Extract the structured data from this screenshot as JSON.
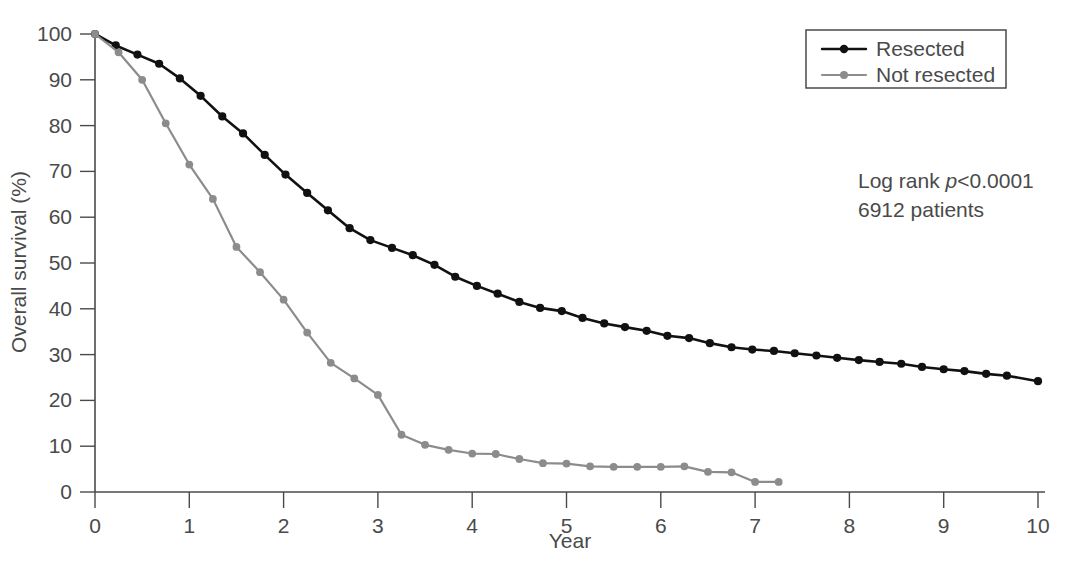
{
  "chart_data": {
    "type": "line",
    "title": "",
    "xlabel": "Year",
    "ylabel": "Overall survival (%)",
    "xlim": [
      0,
      10
    ],
    "ylim": [
      0,
      100
    ],
    "xticks": [
      "0",
      "1",
      "2",
      "3",
      "4",
      "5",
      "6",
      "7",
      "8",
      "9",
      "10"
    ],
    "yticks": [
      "0",
      "10",
      "20",
      "30",
      "40",
      "50",
      "60",
      "70",
      "80",
      "90",
      "100"
    ],
    "grid": false,
    "legend_position": "top-right",
    "series": [
      {
        "name": "Resected",
        "color": "#111111",
        "marker": "circle",
        "x": [
          0,
          0.22,
          0.45,
          0.68,
          0.9,
          1.12,
          1.35,
          1.57,
          1.8,
          2.02,
          2.25,
          2.47,
          2.7,
          2.92,
          3.15,
          3.37,
          3.6,
          3.82,
          4.05,
          4.27,
          4.5,
          4.72,
          4.95,
          5.17,
          5.4,
          5.62,
          5.85,
          6.07,
          6.3,
          6.52,
          6.75,
          6.97,
          7.2,
          7.42,
          7.65,
          7.87,
          8.1,
          8.32,
          8.55,
          8.77,
          9.0,
          9.22,
          9.45,
          9.67,
          10.0
        ],
        "values": [
          100,
          97.5,
          95.5,
          93.5,
          90.3,
          86.5,
          82.0,
          78.3,
          73.6,
          69.3,
          65.3,
          61.5,
          57.6,
          55.0,
          53.3,
          51.7,
          49.6,
          47.0,
          45.0,
          43.3,
          41.5,
          40.2,
          39.5,
          38.0,
          36.8,
          36.0,
          35.2,
          34.1,
          33.6,
          32.5,
          31.6,
          31.1,
          30.8,
          30.3,
          29.8,
          29.3,
          28.8,
          28.4,
          28.0,
          27.3,
          26.8,
          26.4,
          25.8,
          25.4,
          24.2
        ]
      },
      {
        "name": "Not resected",
        "color": "#8c8c8c",
        "marker": "circle",
        "x": [
          0,
          0.25,
          0.5,
          0.75,
          1.0,
          1.25,
          1.5,
          1.75,
          2.0,
          2.25,
          2.5,
          2.75,
          3.0,
          3.25,
          3.5,
          3.75,
          4.0,
          4.25,
          4.5,
          4.75,
          5.0,
          5.25,
          5.5,
          5.75,
          6.0,
          6.25,
          6.5,
          6.75,
          7.0,
          7.25
        ],
        "values": [
          100,
          96.0,
          90.0,
          80.5,
          71.5,
          64.0,
          53.5,
          48.0,
          42.0,
          34.8,
          28.2,
          24.8,
          21.2,
          12.5,
          10.3,
          9.2,
          8.4,
          8.3,
          7.2,
          6.3,
          6.2,
          5.6,
          5.5,
          5.5,
          5.5,
          5.6,
          4.4,
          4.3,
          2.2,
          2.2
        ]
      }
    ],
    "annotations": [
      {
        "text_prefix": "Log rank ",
        "text_italic": "p",
        "text_suffix": "<0.0001"
      },
      {
        "text": "6912 patients"
      }
    ]
  },
  "legend": {
    "items": [
      {
        "label": "Resected"
      },
      {
        "label": "Not resected"
      }
    ]
  },
  "annotation_block": {
    "line1_prefix": "Log rank ",
    "line1_italic": "p",
    "line1_suffix": "<0.0001",
    "line2": "6912 patients"
  },
  "axes": {
    "x_title": "Year",
    "y_title": "Overall survival (%)"
  }
}
